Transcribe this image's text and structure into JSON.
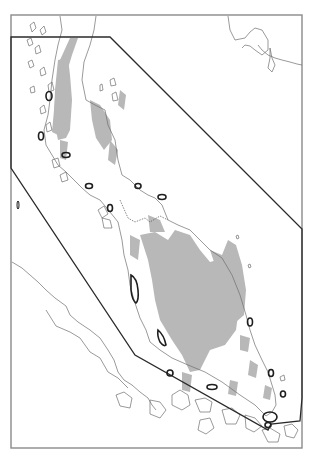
{
  "map": {
    "region": "Malay Peninsula",
    "colors": {
      "background": "#ffffff",
      "frame": "#8a8a8a",
      "coastline": "#6e6e6e",
      "highland": "#b8b8b8",
      "boundary": "#2a2a2a",
      "marker": "#1e1e1e",
      "border_dotted": "#555555"
    },
    "frame": {
      "x": 11,
      "y": 15,
      "width": 291,
      "height": 433
    },
    "boundary_polygon": [
      [
        11,
        37
      ],
      [
        110,
        37
      ],
      [
        302,
        229
      ],
      [
        302,
        398
      ],
      [
        300,
        421
      ],
      [
        271,
        424
      ],
      [
        268,
        430
      ],
      [
        135,
        355
      ],
      [
        11,
        168
      ]
    ],
    "marker_count": 17
  }
}
